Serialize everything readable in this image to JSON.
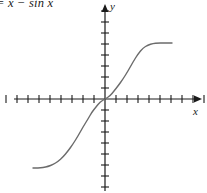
{
  "figure": {
    "equation_label": "= x − sin x",
    "background_color": "#ffffff"
  },
  "axes": {
    "x_label": "x",
    "y_label": "y",
    "axis_color": "#1a1a1a",
    "origin_px": {
      "x": 105,
      "y": 99
    },
    "tick_spacing_px": 11,
    "tick_half_len_px": 4,
    "x_ticks_left": 9,
    "x_ticks_right": 9,
    "y_ticks_up": 8,
    "y_ticks_down": 9,
    "x_axis_start_px": 14,
    "x_axis_end_px": 202,
    "y_axis_top_px": 4,
    "y_axis_bottom_px": 191,
    "arrow_x_direction": "right",
    "arrow_y_direction": "up"
  },
  "chart_data": {
    "type": "line",
    "title": "",
    "subtitle": "",
    "xlabel": "x",
    "ylabel": "y",
    "function": "y = x − sin x",
    "legend": [],
    "legend_position": "none",
    "grid": false,
    "annotations": [
      "= x − sin x"
    ],
    "series": [
      {
        "name": "y = x − sin x",
        "color": "#6b6b6b",
        "line_width_px": 1.4,
        "points_px": [
          [
            33,
            168
          ],
          [
            38,
            168
          ],
          [
            43,
            167.5
          ],
          [
            48,
            166.5
          ],
          [
            53,
            164.5
          ],
          [
            58,
            161.5
          ],
          [
            63,
            157
          ],
          [
            68,
            151
          ],
          [
            73,
            144
          ],
          [
            78,
            136
          ],
          [
            83,
            127
          ],
          [
            88,
            119
          ],
          [
            92,
            112
          ],
          [
            96,
            107
          ],
          [
            100,
            102
          ],
          [
            105,
            99
          ],
          [
            110,
            96
          ],
          [
            114,
            91
          ],
          [
            118,
            86
          ],
          [
            123,
            79
          ],
          [
            128,
            71
          ],
          [
            133,
            62
          ],
          [
            138,
            54
          ],
          [
            143,
            48
          ],
          [
            148,
            45
          ],
          [
            153,
            43.5
          ],
          [
            158,
            43
          ],
          [
            163,
            43
          ],
          [
            168,
            43
          ],
          [
            172,
            43
          ]
        ],
        "x_px_range": [
          33,
          172
        ],
        "y_px_range": [
          43,
          168
        ]
      }
    ]
  }
}
